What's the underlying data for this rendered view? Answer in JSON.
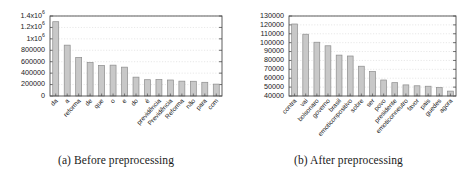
{
  "figure": {
    "subfigures": [
      {
        "caption": "(a) Before preprocessing"
      },
      {
        "caption": "(b) After preprocessing"
      }
    ]
  },
  "colors": {
    "bar_fill": "#c8c8c8",
    "bar_stroke": "#8c8c8c",
    "axis": "#4d4d4d",
    "grid": "#d9d9d9",
    "text": "#1a1a1a"
  },
  "chart_data": [
    {
      "type": "bar",
      "title": "",
      "caption": "(a) Before preprocessing",
      "xlabel": "",
      "ylabel": "",
      "ylim": [
        0,
        1400000
      ],
      "yticks": [
        0,
        200000,
        400000,
        600000,
        800000,
        1000000,
        1200000,
        1400000
      ],
      "ytick_labels": [
        "0",
        "200000",
        "400000",
        "600000",
        "800000",
        "1x10⁶",
        "1.2x10⁶",
        "1.4x10⁶"
      ],
      "grid": true,
      "legend": "none",
      "categories": [
        "da",
        "a",
        "reforma",
        "de",
        "que",
        "o",
        "e",
        "do",
        "é",
        "previdência",
        "Previdência",
        "Reforma",
        "não",
        "para",
        "com"
      ],
      "values": [
        1300000,
        890000,
        675000,
        585000,
        535000,
        540000,
        505000,
        330000,
        285000,
        288000,
        280000,
        260000,
        258000,
        240000,
        208000
      ]
    },
    {
      "type": "bar",
      "title": "",
      "caption": "(b) After preprocessing",
      "xlabel": "",
      "ylabel": "",
      "ylim": [
        40000,
        130000
      ],
      "yticks": [
        40000,
        50000,
        60000,
        70000,
        80000,
        90000,
        100000,
        110000,
        120000,
        130000
      ],
      "ytick_labels": [
        "40000",
        "50000",
        "60000",
        "70000",
        "80000",
        "90000",
        "100000",
        "110000",
        "120000",
        "130000"
      ],
      "grid": true,
      "legend": "none",
      "categories": [
        "contra",
        "vai",
        "bolsonaro",
        "governo",
        "brasil",
        "emoticonpositivo",
        "sobre",
        "ser",
        "povo",
        "presidente",
        "emoticonneutro",
        "favor",
        "pais",
        "guedes",
        "agora"
      ],
      "values": [
        121000,
        109500,
        100500,
        96500,
        86000,
        85000,
        73500,
        67500,
        58000,
        55000,
        52500,
        51500,
        51000,
        49500,
        45500
      ]
    }
  ]
}
